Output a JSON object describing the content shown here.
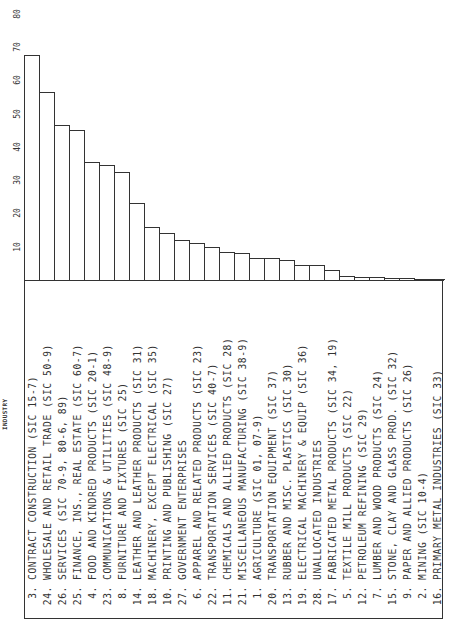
{
  "chart_data": {
    "type": "bar",
    "orientation": "rotated-90-horizontal-bars",
    "title": "",
    "category_header": "INDUSTRY",
    "xlabel": "INDUSTRY",
    "ylabel": "",
    "ylim": [
      0,
      80
    ],
    "ticks": [
      10,
      20,
      30,
      40,
      50,
      60,
      70,
      80
    ],
    "grid": false,
    "legend": null,
    "categories": [
      {
        "num": "3.",
        "label": "CONTRACT CONSTRUCTION (SIC 15-7)"
      },
      {
        "num": "24.",
        "label": "WHOLESALE AND RETAIL TRADE (SIC 50-9)"
      },
      {
        "num": "26.",
        "label": "SERVICES (SIC 70-9, 80-6, 89)"
      },
      {
        "num": "25.",
        "label": "FINANCE, INS., REAL ESTATE (SIC 60-7)"
      },
      {
        "num": "4.",
        "label": "FOOD AND KINDRED PRODUCTS (SIC 20-1)"
      },
      {
        "num": "23.",
        "label": "COMMUNICATIONS & UTILITIES (SIC 48-9)"
      },
      {
        "num": "8.",
        "label": "FURNITURE AND FIXTURES (SIC 25)"
      },
      {
        "num": "14.",
        "label": "LEATHER AND LEATHER PRODUCTS (SIC 31)"
      },
      {
        "num": "18.",
        "label": "MACHINERY, EXCEPT ELECTRICAL (SIC 35)"
      },
      {
        "num": "10.",
        "label": "PRINTING AND PUBLISHING (SIC 27)"
      },
      {
        "num": "27.",
        "label": "GOVERNMENT ENTERPRISES"
      },
      {
        "num": "6.",
        "label": "APPAREL AND RELATED PRODUCTS (SIC 23)"
      },
      {
        "num": "22.",
        "label": "TRANSPORTATION SERVICES (SIC 40-7)"
      },
      {
        "num": "11.",
        "label": "CHEMICALS AND ALLIED PRODUCTS (SIC 28)"
      },
      {
        "num": "21.",
        "label": "MISCELLANEOUS MANUFACTURING (SIC 38-9)"
      },
      {
        "num": "1.",
        "label": "AGRICULTURE (SIC 01, 07-9)"
      },
      {
        "num": "20.",
        "label": "TRANSPORTATION EQUIPMENT (SIC 37)"
      },
      {
        "num": "13.",
        "label": "RUBBER AND MISC. PLASTICS (SIC 30)"
      },
      {
        "num": "19.",
        "label": "ELECTRICAL MACHINERY & EQUIP (SIC 36)"
      },
      {
        "num": "28.",
        "label": "UNALLOCATED INDUSTRIES"
      },
      {
        "num": "17.",
        "label": "FABRICATED METAL PRODUCTS (SIC 34, 19)"
      },
      {
        "num": "5.",
        "label": "TEXTILE MILL PRODUCTS (SIC 22)"
      },
      {
        "num": "12.",
        "label": "PETROLEUM REFINING (SIC 29)"
      },
      {
        "num": "7.",
        "label": "LUMBER AND WOOD PRODUCTS (SIC 24)"
      },
      {
        "num": "15.",
        "label": "STONE, CLAY AND GLASS PROD.  (SIC 32)"
      },
      {
        "num": "9.",
        "label": "PAPER AND ALLIED PRODUCTS (SIC 26)"
      },
      {
        "num": "2.",
        "label": "MINING (SIC 10-4)"
      },
      {
        "num": "16.",
        "label": "PRIMARY METAL INDUSTRIES (SIC 33)"
      }
    ],
    "values": [
      67.5,
      56.5,
      46.5,
      45,
      35.5,
      34.5,
      32.5,
      23,
      16,
      14,
      12,
      11,
      10,
      8.5,
      8,
      6.5,
      6.5,
      6,
      4.5,
      4.5,
      3,
      1.2,
      0.9,
      0.8,
      0.6,
      0.5,
      0.3,
      0.1
    ]
  },
  "colors": {
    "line": "#333333",
    "bar_fill": "#ffffff",
    "background": "#ffffff"
  }
}
